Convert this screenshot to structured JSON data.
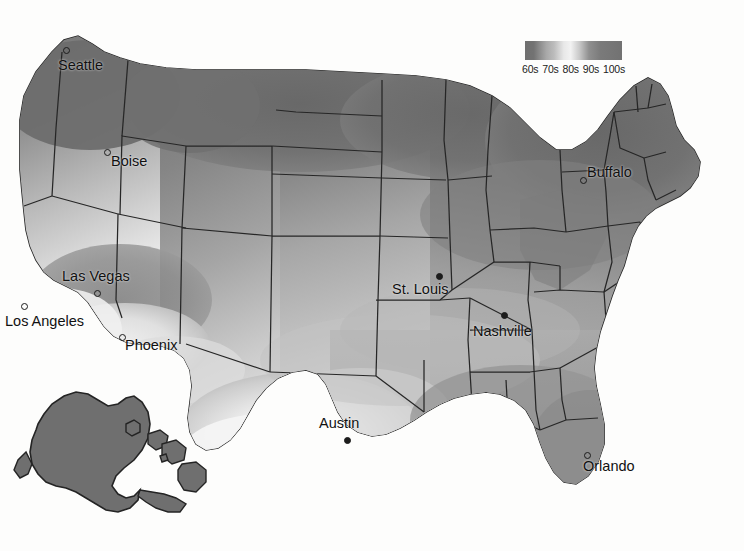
{
  "map": {
    "title": "United States record high temperature map",
    "projection_note": "contiguous US with Alaska and Hawaii insets",
    "background_color": "#fdfdfc",
    "border_color": "#222222",
    "inset_fill": "#6f6f6f"
  },
  "legend": {
    "name": "temperature-gradient-legend",
    "ticks": [
      "60s",
      "70s",
      "80s",
      "90s",
      "100s"
    ],
    "gradient_stops": [
      "#6f6f6f",
      "#a8a8a8",
      "#f2f2f2",
      "#9a9a9a",
      "#727272"
    ],
    "x": 525,
    "y": 41,
    "width": 97,
    "height": 19
  },
  "cities": [
    {
      "name": "Seattle",
      "label": "Seattle",
      "dot_x": 63,
      "dot_y": 47,
      "lbl_x": 58,
      "lbl_y": 57,
      "marker": "hollow"
    },
    {
      "name": "Boise",
      "label": "Boise",
      "dot_x": 104,
      "dot_y": 149,
      "lbl_x": 111,
      "lbl_y": 153,
      "marker": "hollow"
    },
    {
      "name": "Las Vegas",
      "label": "Las Vegas",
      "dot_x": 94,
      "dot_y": 290,
      "lbl_x": 62,
      "lbl_y": 268,
      "marker": "hollow"
    },
    {
      "name": "Los Angeles",
      "label": "Los Angeles",
      "dot_x": 21,
      "dot_y": 303,
      "lbl_x": 5,
      "lbl_y": 313,
      "marker": "hollow"
    },
    {
      "name": "Phoenix",
      "label": "Phoenix",
      "dot_x": 119,
      "dot_y": 334,
      "lbl_x": 125,
      "lbl_y": 337,
      "marker": "hollow"
    },
    {
      "name": "Austin",
      "label": "Austin",
      "dot_x": 344,
      "dot_y": 437,
      "lbl_x": 319,
      "lbl_y": 415,
      "marker": "filled"
    },
    {
      "name": "St. Louis",
      "label": "St. Louis",
      "dot_x": 436,
      "dot_y": 273,
      "lbl_x": 392,
      "lbl_y": 281,
      "marker": "filled"
    },
    {
      "name": "Nashville",
      "label": "Nashville",
      "dot_x": 501,
      "dot_y": 312,
      "lbl_x": 473,
      "lbl_y": 323,
      "marker": "filled"
    },
    {
      "name": "Buffalo",
      "label": "Buffalo",
      "dot_x": 580,
      "dot_y": 177,
      "lbl_x": 587,
      "lbl_y": 164,
      "marker": "hollow"
    },
    {
      "name": "Orlando",
      "label": "Orlando",
      "dot_x": 584,
      "dot_y": 452,
      "lbl_x": 583,
      "lbl_y": 458,
      "marker": "hollow"
    }
  ],
  "chart_data": {
    "type": "heatmap",
    "legend_label": "Temperature (°F)",
    "categories": [
      "60s",
      "70s",
      "80s",
      "90s",
      "100s"
    ],
    "colors": [
      "#6f6f6f",
      "#a8a8a8",
      "#f2f2f2",
      "#9a9a9a",
      "#727272"
    ],
    "regions": [
      {
        "region": "Pacific Northwest (Seattle)",
        "band": "60s",
        "shade": "#6f6f6f"
      },
      {
        "region": "Northern Rockies / Idaho (Boise)",
        "band": "70s",
        "shade": "#8f8f8f"
      },
      {
        "region": "Northern Plains / Dakotas",
        "band": "60s",
        "shade": "#6f6f6f"
      },
      {
        "region": "Upper Midwest / Minnesota",
        "band": "60s",
        "shade": "#6f6f6f"
      },
      {
        "region": "Great Lakes / New York (Buffalo)",
        "band": "60s",
        "shade": "#6f6f6f"
      },
      {
        "region": "New England",
        "band": "60s",
        "shade": "#6f6f6f"
      },
      {
        "region": "Central Plains / Nebraska",
        "band": "80s",
        "shade": "#b5b5b5"
      },
      {
        "region": "Missouri (St. Louis)",
        "band": "80s",
        "shade": "#b0b0b0"
      },
      {
        "region": "Tennessee (Nashville)",
        "band": "80s",
        "shade": "#a8a8a8"
      },
      {
        "region": "Desert Southwest (Las Vegas)",
        "band": "90s",
        "shade": "#8a8a8a"
      },
      {
        "region": "Arizona (Phoenix)",
        "band": "100s",
        "shade": "#f0f0f0"
      },
      {
        "region": "Southern California (Los Angeles)",
        "band": "100s",
        "shade": "#ededed"
      },
      {
        "region": "South Texas (Austin)",
        "band": "100s",
        "shade": "#f2f2f2"
      },
      {
        "region": "Gulf Coast / Deep South",
        "band": "90s",
        "shade": "#9a9a9a"
      },
      {
        "region": "Florida (Orlando)",
        "band": "80s",
        "shade": "#949494"
      },
      {
        "region": "Alaska (inset)",
        "band": "60s",
        "shade": "#6f6f6f"
      },
      {
        "region": "Hawaii (inset)",
        "band": "60s",
        "shade": "#6f6f6f"
      }
    ],
    "xlabel": "",
    "ylabel": "",
    "grid": false,
    "legend_position": "top-right"
  }
}
